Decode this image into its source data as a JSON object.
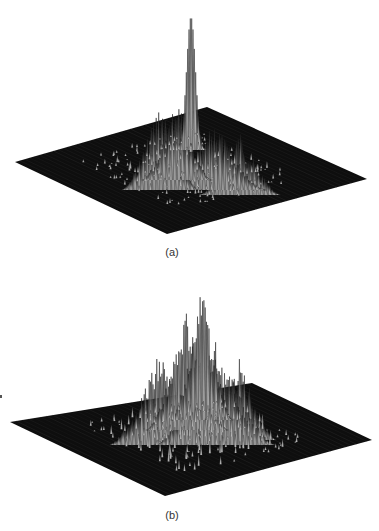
{
  "figure": {
    "background": "#ffffff",
    "plane_color": "#0e0e0e",
    "mesh_color": "#d8d8d8",
    "mesh_shadow": "#1a1a1a",
    "panels": [
      {
        "id": "a",
        "label": "(a)",
        "label_pos": [
          172,
          253
        ],
        "plane": {
          "left": [
            15,
            162
          ],
          "back": [
            207,
            107
          ],
          "right": [
            367,
            179
          ],
          "front": [
            167,
            234
          ]
        },
        "peaks": [
          {
            "x": 191,
            "y": 17,
            "base_y": 150,
            "width": 14,
            "kind": "sharp"
          },
          {
            "x": 177,
            "y": 95,
            "base_y": 180,
            "width": 34,
            "kind": "rough"
          },
          {
            "x": 160,
            "y": 99,
            "base_y": 190,
            "width": 38,
            "kind": "rough"
          },
          {
            "x": 215,
            "y": 120,
            "base_y": 190,
            "width": 50,
            "kind": "rough"
          },
          {
            "x": 240,
            "y": 130,
            "base_y": 195,
            "width": 40,
            "kind": "rough"
          }
        ]
      },
      {
        "id": "b",
        "label": "(b)",
        "label_pos": [
          172,
          516
        ],
        "plane": {
          "left": [
            10,
            422
          ],
          "back": [
            252,
            383
          ],
          "right": [
            372,
            440
          ],
          "front": [
            165,
            496
          ]
        },
        "peaks": [
          {
            "x": 202,
            "y": 281,
            "base_y": 420,
            "width": 30,
            "kind": "rough"
          },
          {
            "x": 187,
            "y": 306,
            "base_y": 430,
            "width": 40,
            "kind": "rough"
          },
          {
            "x": 240,
            "y": 357,
            "base_y": 440,
            "width": 36,
            "kind": "rough"
          },
          {
            "x": 160,
            "y": 350,
            "base_y": 445,
            "width": 50,
            "kind": "rough"
          },
          {
            "x": 215,
            "y": 340,
            "base_y": 445,
            "width": 60,
            "kind": "rough"
          }
        ]
      }
    ]
  },
  "chart_data": [
    {
      "type": "surface",
      "title": "(a)",
      "description": "3D mesh surface plot over a square grid; single dominant sharp peak near the centre rising far above a cluster of lower rough peaks; flat dark base plane elsewhere",
      "xlabel": "",
      "ylabel": "",
      "zlabel": "",
      "grid": false,
      "legend": null,
      "features": {
        "main_peak_relative_height": 1.0,
        "secondary_peaks_relative_height": [
          0.55,
          0.53,
          0.4,
          0.35
        ],
        "peak_position": "centre, slightly towards back"
      }
    },
    {
      "type": "surface",
      "title": "(b)",
      "description": "3D mesh surface plot over a square grid; broader, rougher central mountain with multiple comparable spiky peaks and no single dominant spike; flat dark base plane elsewhere",
      "xlabel": "",
      "ylabel": "",
      "zlabel": "",
      "grid": false,
      "legend": null,
      "features": {
        "main_peak_relative_height": 1.0,
        "secondary_peaks_relative_height": [
          0.85,
          0.55,
          0.6,
          0.65
        ],
        "peak_position": "centre"
      }
    }
  ]
}
